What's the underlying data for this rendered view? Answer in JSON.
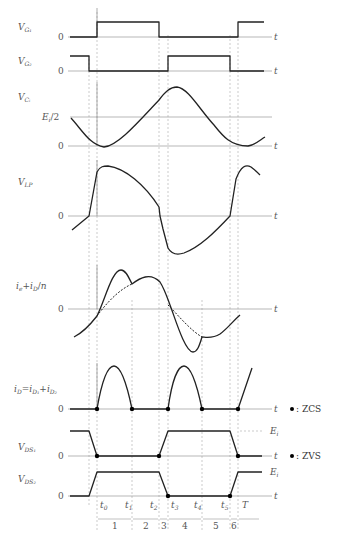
{
  "diagram": {
    "type": "timing-waveform",
    "time_axis_label": "t",
    "time_markers": [
      "t0",
      "t1",
      "t2",
      "t3",
      "t4",
      "t5",
      "T"
    ],
    "intervals": [
      "1",
      "2",
      "3",
      "4",
      "5",
      "6"
    ],
    "signals": [
      {
        "id": "vg1",
        "label": "V_G1",
        "zero_label": "0"
      },
      {
        "id": "vg2",
        "label": "V_G2",
        "zero_label": "0"
      },
      {
        "id": "vci",
        "label": "V_Ci",
        "zero_label": "0",
        "level_label": "Ei/2"
      },
      {
        "id": "vlp",
        "label": "V_LP",
        "zero_label": "0"
      },
      {
        "id": "ie",
        "label": "ie + iD/n",
        "zero_label": "0"
      },
      {
        "id": "id",
        "label": "iD = iD1 + iD2",
        "zero_label": "0"
      },
      {
        "id": "vds1",
        "label": "V_DS1",
        "zero_label": "0",
        "level_label": "Ei"
      },
      {
        "id": "vds2",
        "label": "V_DS2",
        "zero_label": "0",
        "level_label": "Ei"
      }
    ],
    "legend": [
      {
        "marker": "●",
        "text": ": ZCS"
      },
      {
        "marker": "●",
        "text": ": ZVS"
      }
    ]
  },
  "labels": {
    "t": "t",
    "zero": "0",
    "ei_half": "/2",
    "ei": "E",
    "t_mk": [
      "t",
      "t",
      "t",
      "t",
      "t",
      "t"
    ],
    "t_sub": [
      "0",
      "1",
      "2",
      "3",
      "4",
      "5"
    ],
    "T": "T",
    "intervals": [
      "1",
      "2",
      "3",
      "4",
      "5",
      "6"
    ],
    "zcs": ": ZCS",
    "zvs": ": ZVS"
  }
}
